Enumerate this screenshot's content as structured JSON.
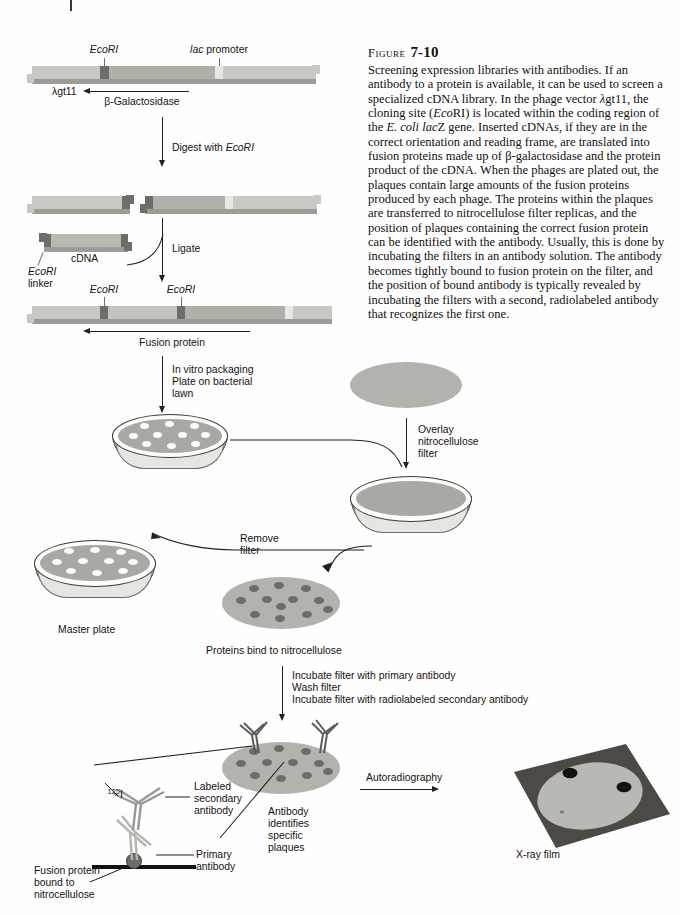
{
  "figure": {
    "label_word": "Figure",
    "number": "7-10",
    "caption": "Screening expression libraries with antibodies. If an antibody to a protein is available, it can be used to screen a specialized cDNA library. In the phage vector λgt11, the cloning site (EcoRI) is located within the coding region of the E. coli lacZ gene. Inserted cDNAs, if they are in the correct orientation and reading frame, are translated into fusion proteins made up of β-galactosidase and the protein product of the cDNA. When the phages are plated out, the plaques contain large amounts of the fusion proteins produced by each phage. The proteins within the plaques are transferred to nitrocellulose filter replicas, and the position of plaques containing the correct fusion protein can be identified with the antibody. Usually, this is done by incubating the filters in an antibody solution. The antibody becomes tightly bound to fusion protein on the filter, and the position of bound antibody is typically revealed by incubating the filters with a second, radiolabeled antibody that recognizes the first one."
  },
  "diagram": {
    "vector_ecori": "EcoRI",
    "vector_lac_promoter": "lac promoter",
    "vector_name": "λgt11",
    "vector_gene": "β-Galactosidase",
    "step_digest": "Digest with EcoRI",
    "step_digest_enzyme": "EcoRI",
    "step_digest_prefix": "Digest with ",
    "cdna_label": "cDNA",
    "ecori_linker_line1": "EcoRI",
    "ecori_linker_line2": "linker",
    "step_ligate": "Ligate",
    "recomb_ecori_left": "EcoRI",
    "recomb_ecori_right": "EcoRI",
    "fusion_protein": "Fusion protein",
    "step_package_line1": "In vitro packaging",
    "step_package_line2": "Plate on bacterial",
    "step_package_line3": "lawn",
    "step_overlay_line1": "Overlay",
    "step_overlay_line2": "nitrocellulose",
    "step_overlay_line3": "filter",
    "step_remove_line1": "Remove",
    "step_remove_line2": "filter",
    "master_plate": "Master plate",
    "proteins_bind": "Proteins bind to nitrocellulose",
    "step_incubate_line1": "Incubate filter with primary antibody",
    "step_incubate_line2": "Wash filter",
    "step_incubate_line3": "Incubate filter with radiolabeled secondary antibody",
    "iodine_isotope": "125",
    "iodine_element": "I",
    "labeled_secondary_line1": "Labeled",
    "labeled_secondary_line2": "secondary",
    "labeled_secondary_line3": "antibody",
    "primary_line1": "Primary",
    "primary_line2": "antibody",
    "fusion_bound_line1": "Fusion protein",
    "fusion_bound_line2": "bound to",
    "fusion_bound_line3": "nitrocellulose",
    "antibody_identifies_line1": "Antibody",
    "antibody_identifies_line2": "identifies",
    "antibody_identifies_line3": "specific",
    "antibody_identifies_line4": "plaques",
    "step_autoradiography": "Autoradiography",
    "xray_film": "X-ray film"
  },
  "colors": {
    "dna_light": "#c9c9c3",
    "dna_mid": "#b0b0a9",
    "dna_dark": "#6e6e69",
    "dna_pale": "#e2e2dd",
    "agar": "#a9a9a4",
    "plaque": "#fbfbfa",
    "filter": "#b3b3ae",
    "spot": "#6d6d68",
    "film_dark": "#4d4a46",
    "film_light": "#b9b9b3",
    "ink": "#231f1c"
  }
}
